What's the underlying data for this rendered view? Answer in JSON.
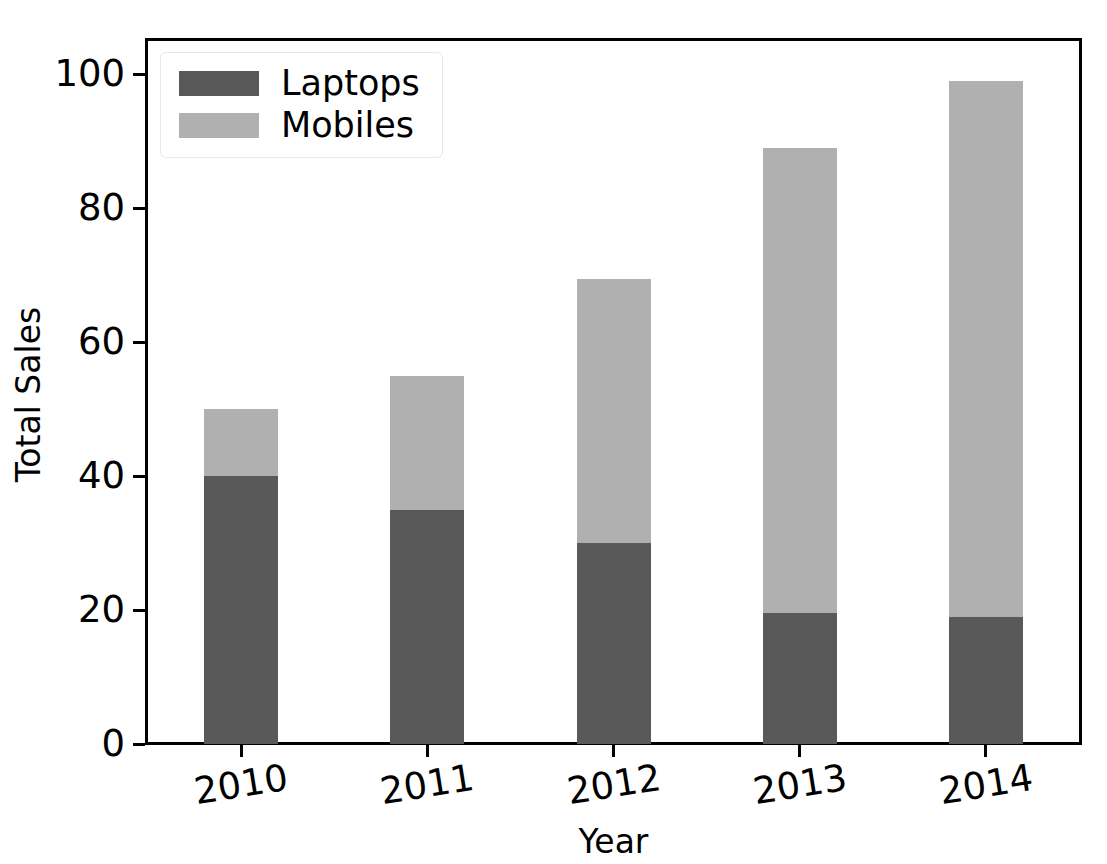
{
  "chart_data": {
    "type": "bar",
    "subtype": "stacked-vertical",
    "title": "",
    "xlabel": "Year",
    "ylabel": "Total Sales",
    "categories": [
      "2010",
      "2011",
      "2012",
      "2013",
      "2014"
    ],
    "series": [
      {
        "name": "Laptops",
        "color": "#595959",
        "values": [
          40,
          35,
          30,
          19.5,
          19
        ]
      },
      {
        "name": "Mobiles",
        "color": "#b0b0b0",
        "values": [
          10,
          20,
          39.5,
          69.5,
          80
        ]
      }
    ],
    "totals": [
      50,
      55,
      69.5,
      89,
      99
    ],
    "ylim": [
      0,
      105
    ],
    "yticks": [
      "0",
      "20",
      "40",
      "60",
      "80",
      "100"
    ],
    "ytick_values": [
      0,
      20,
      40,
      60,
      80,
      100
    ],
    "xtick_labels": [
      "2010",
      "2011",
      "2012",
      "2013",
      "2014"
    ],
    "grid": false,
    "legend_position": "upper left",
    "legend_entries": [
      "Laptops",
      "Mobiles"
    ],
    "background_color": "#ffffff",
    "axis_color": "#000000"
  },
  "legend": {
    "entries": [
      {
        "label": "Laptops",
        "color": "#595959"
      },
      {
        "label": "Mobiles",
        "color": "#b0b0b0"
      }
    ]
  },
  "axes": {
    "ylabel": "Total Sales",
    "xlabel": "Year",
    "yticks": [
      "0",
      "20",
      "40",
      "60",
      "80",
      "100"
    ],
    "xticks": [
      "2010",
      "2011",
      "2012",
      "2013",
      "2014"
    ]
  }
}
